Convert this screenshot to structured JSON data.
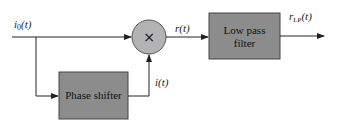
{
  "diagram": {
    "type": "block-diagram",
    "input_signal": {
      "label": "i",
      "subscript": "0",
      "arg": "(t)"
    },
    "multiplier": {
      "symbol": "×"
    },
    "phase_shifter": {
      "label": "Phase shifter",
      "output": "i(t)"
    },
    "mixer_output": {
      "label": "r(t)"
    },
    "lpf": {
      "line1": "Low pass",
      "line2": "filter"
    },
    "output_signal": {
      "label": "r",
      "subscript": "LP",
      "arg": "(t)"
    },
    "colors": {
      "box_fill": "#8c8c8c",
      "circle_fill": "#b3b3b3",
      "line": "#222222"
    }
  }
}
